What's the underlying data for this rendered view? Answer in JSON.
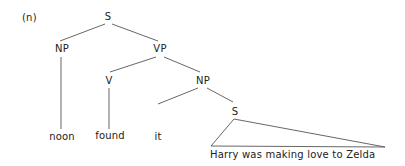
{
  "example_label": "(n)",
  "nodes": {
    "root_s": "S",
    "subject_np": "NP",
    "vp": "VP",
    "verb": "V",
    "object_np": "NP",
    "embedded_s": "S"
  },
  "leaves": {
    "subject": "noon",
    "verb": "found",
    "pronoun": "it",
    "clause": "Harry was making love to Zelda"
  },
  "colors": {
    "text": "#222222",
    "lines": "#555555",
    "background": "#ffffff"
  }
}
